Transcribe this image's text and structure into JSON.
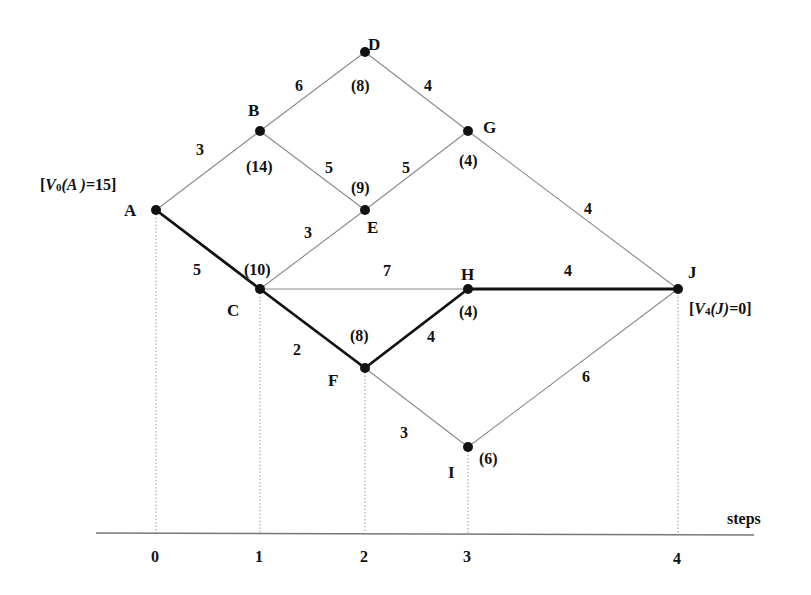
{
  "diagram": {
    "type": "shortest-path dynamic programming network",
    "axis": {
      "label": "steps",
      "ticks": [
        {
          "label": "0",
          "x": 156
        },
        {
          "label": "1",
          "x": 260
        },
        {
          "label": "2",
          "x": 365
        },
        {
          "label": "3",
          "x": 468
        },
        {
          "label": "4",
          "x": 678
        }
      ]
    },
    "nodes": {
      "A": {
        "label": "A",
        "value": "",
        "x": 156,
        "y": 210
      },
      "B": {
        "label": "B",
        "value": "(14)",
        "x": 260,
        "y": 131
      },
      "C": {
        "label": "C",
        "value": "(10)",
        "x": 260,
        "y": 289
      },
      "D": {
        "label": "D",
        "value": "(8)",
        "x": 365,
        "y": 52
      },
      "E": {
        "label": "E",
        "value": "(9)",
        "x": 365,
        "y": 210
      },
      "F": {
        "label": "F",
        "value": "(8)",
        "x": 365,
        "y": 368
      },
      "G": {
        "label": "G",
        "value": "(4)",
        "x": 468,
        "y": 131
      },
      "H": {
        "label": "H",
        "value": "(4)",
        "x": 468,
        "y": 289
      },
      "I": {
        "label": "I",
        "value": "(6)",
        "x": 468,
        "y": 447
      },
      "J": {
        "label": "J",
        "value": "",
        "x": 678,
        "y": 289
      }
    },
    "edges": [
      {
        "from": "A",
        "to": "B",
        "weight": "3",
        "optimal": false
      },
      {
        "from": "A",
        "to": "C",
        "weight": "5",
        "optimal": true
      },
      {
        "from": "B",
        "to": "D",
        "weight": "6",
        "optimal": false
      },
      {
        "from": "B",
        "to": "E",
        "weight": "5",
        "optimal": false
      },
      {
        "from": "C",
        "to": "E",
        "weight": "3",
        "optimal": false
      },
      {
        "from": "C",
        "to": "H",
        "weight": "7",
        "optimal": false
      },
      {
        "from": "C",
        "to": "F",
        "weight": "2",
        "optimal": true
      },
      {
        "from": "D",
        "to": "G",
        "weight": "4",
        "optimal": false
      },
      {
        "from": "E",
        "to": "G",
        "weight": "5",
        "optimal": false
      },
      {
        "from": "F",
        "to": "H",
        "weight": "4",
        "optimal": true
      },
      {
        "from": "F",
        "to": "I",
        "weight": "3",
        "optimal": false
      },
      {
        "from": "G",
        "to": "J",
        "weight": "4",
        "optimal": false
      },
      {
        "from": "H",
        "to": "J",
        "weight": "4",
        "optimal": true
      },
      {
        "from": "I",
        "to": "J",
        "weight": "6",
        "optimal": false
      }
    ],
    "annotations": {
      "start": {
        "prefix": "[",
        "V": "V",
        "sub": "0",
        "arg": "(A )",
        "rest": "=15]"
      },
      "end": {
        "prefix": "[",
        "V": "V",
        "sub": "4",
        "arg": "(J)",
        "rest": "=0]"
      }
    },
    "colors": {
      "edge": "#8a8a8a",
      "optimal_edge": "#111111",
      "node": "#111111",
      "guide": "#9a9a9a"
    }
  }
}
